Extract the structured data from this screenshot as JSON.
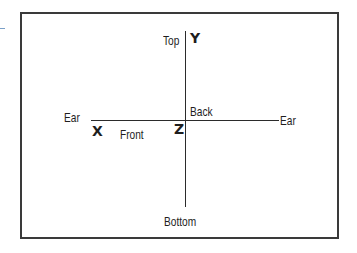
{
  "diagram": {
    "title": "",
    "type": "coordinate-axes",
    "colors": {
      "frame": "#3a3a3a",
      "axis": "#2b2b2b",
      "text": "#1e1e1e",
      "margin_mark": "#7aa0c8"
    },
    "axes": {
      "horizontal": {
        "left_end_label": "Ear",
        "right_end_label": "Ear"
      },
      "vertical": {
        "top_end_label": "Top",
        "bottom_end_label": "Bottom"
      }
    },
    "axis_letters": {
      "x": "X",
      "y": "Y",
      "z": "Z"
    },
    "direction_labels": {
      "front": "Front",
      "back": "Back"
    }
  }
}
